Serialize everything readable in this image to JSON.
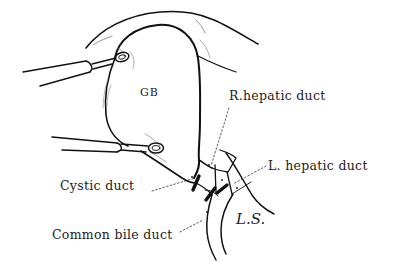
{
  "figure": {
    "type": "anatomical line drawing",
    "colors": {
      "background": "#ffffff",
      "ink": "#111111",
      "label_text": "#222222"
    }
  },
  "labels": {
    "gallbladder": "GB",
    "right_hepatic_duct": "R.hepatic duct",
    "left_hepatic_duct": "L. hepatic duct",
    "cystic_duct": "Cystic duct",
    "common_bile_duct": "Common bile duct",
    "signature": "L.S."
  },
  "instruments": [
    {
      "name": "upper-clamp",
      "position": "upper left, grasping gallbladder fundus"
    },
    {
      "name": "lower-clamp",
      "position": "mid left, grasping gallbladder neck"
    }
  ]
}
